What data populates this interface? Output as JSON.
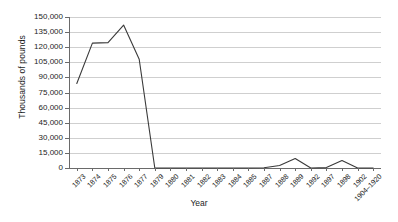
{
  "chart_data": {
    "type": "line",
    "title": "",
    "xlabel": "Year",
    "ylabel": "Thousands of pounds",
    "ylim": [
      0,
      150000
    ],
    "yticks": [
      0,
      15000,
      30000,
      45000,
      60000,
      75000,
      90000,
      105000,
      120000,
      135000,
      150000
    ],
    "ytick_labels": [
      "0",
      "15,000",
      "30,000",
      "45,000",
      "60,000",
      "75,000",
      "90,000",
      "105,000",
      "120,000",
      "135,000",
      "150,000"
    ],
    "grid": "horizontal",
    "legend": "none",
    "categories": [
      "1873",
      "1874",
      "1875",
      "1876",
      "1877",
      "1879",
      "1880",
      "1881",
      "1882",
      "1883",
      "1884",
      "1885",
      "1887",
      "1888",
      "1889",
      "1892",
      "1897",
      "1898",
      "1902",
      "1904–1920"
    ],
    "series": [
      {
        "name": "Value",
        "values": [
          84000,
          124000,
          124500,
          142000,
          108000,
          0,
          0,
          0,
          0,
          0,
          0,
          0,
          200,
          2500,
          9500,
          0,
          400,
          7500,
          0,
          0
        ]
      }
    ]
  },
  "axes": {
    "y_title": "Thousands of pounds",
    "x_title": "Year"
  },
  "colors": {
    "line": "#3a3a3a",
    "grid": "#cfcfcf",
    "axis": "#6a6a6a",
    "text": "#1d1d1d",
    "background": "#ffffff"
  }
}
